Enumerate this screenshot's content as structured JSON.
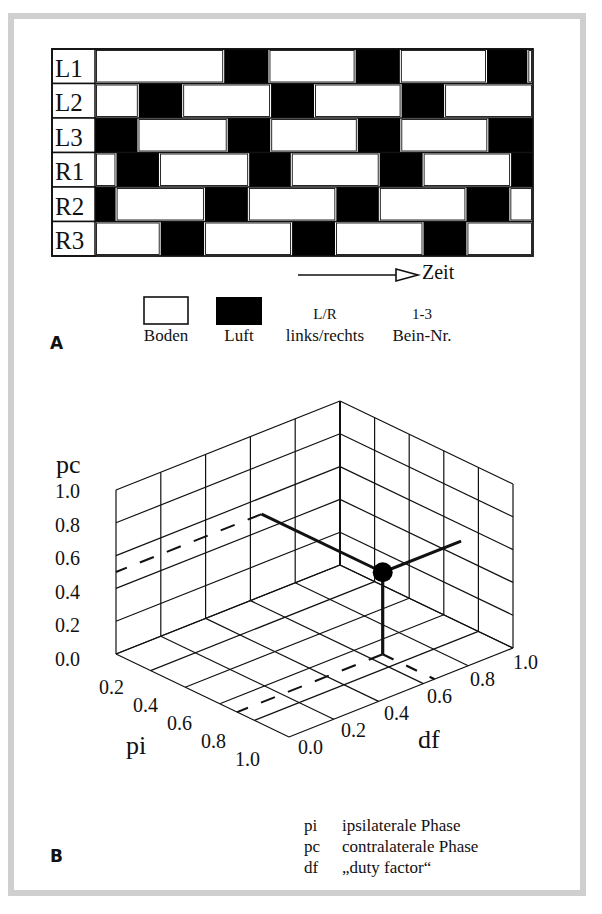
{
  "panel_a": {
    "letter": "A",
    "rows": [
      {
        "label": "L1",
        "air": [
          [
            0.295,
            0.396
          ],
          [
            0.595,
            0.696
          ],
          [
            0.895,
            0.987
          ]
        ]
      },
      {
        "label": "L2",
        "air": [
          [
            0.1,
            0.199
          ],
          [
            0.402,
            0.5
          ],
          [
            0.7,
            0.797
          ]
        ]
      },
      {
        "label": "L3",
        "air": [
          [
            0.0,
            0.097
          ],
          [
            0.303,
            0.4
          ],
          [
            0.6,
            0.697
          ],
          [
            0.898,
            1.0
          ]
        ]
      },
      {
        "label": "R1",
        "air": [
          [
            0.049,
            0.146
          ],
          [
            0.352,
            0.447
          ],
          [
            0.65,
            0.748
          ],
          [
            0.95,
            1.0
          ]
        ]
      },
      {
        "label": "R2",
        "air": [
          [
            0.0,
            0.047
          ],
          [
            0.251,
            0.349
          ],
          [
            0.551,
            0.648
          ],
          [
            0.848,
            0.946
          ]
        ]
      },
      {
        "label": "R3",
        "air": [
          [
            0.15,
            0.249
          ],
          [
            0.45,
            0.548
          ],
          [
            0.75,
            0.848
          ]
        ]
      }
    ],
    "time_label": "Zeit",
    "legend": {
      "ground_label": "Boden",
      "air_label": "Luft",
      "lr_top": "L/R",
      "lr_bottom": "links/rechts",
      "num_top": "1-3",
      "num_bottom": "Bein-Nr."
    },
    "colors": {
      "ground": "#ffffff",
      "air": "#000000"
    }
  },
  "panel_b": {
    "letter": "B",
    "pc_label": "pc",
    "pi_label": "pi",
    "df_label": "df",
    "glossary": [
      {
        "abbr": "pi",
        "text": "ipsilaterale Phase"
      },
      {
        "abbr": "pc",
        "text": "contralaterale Phase"
      },
      {
        "abbr": "df",
        "text": "„duty factor“"
      }
    ]
  },
  "chart_data": {
    "type": "scatter3d",
    "title": "",
    "axes": {
      "x": {
        "label": "pi",
        "range": [
          0.0,
          1.0
        ],
        "ticks": [
          "0.2",
          "0.4",
          "0.6",
          "0.8",
          "1.0"
        ]
      },
      "y": {
        "label": "df",
        "range": [
          0.0,
          1.0
        ],
        "ticks": [
          "0.0",
          "0.2",
          "0.4",
          "0.6",
          "0.8",
          "1.0"
        ]
      },
      "z": {
        "label": "pc",
        "range": [
          0.0,
          1.0
        ],
        "ticks": [
          "0.0",
          "0.2",
          "0.4",
          "0.6",
          "0.8",
          "1.0"
        ]
      }
    },
    "points": [
      {
        "pi": 0.7,
        "df": 0.65,
        "pc": 0.5
      }
    ],
    "grid": true,
    "projection_lines": "solid to walls/floor, dashed extension to axes"
  }
}
